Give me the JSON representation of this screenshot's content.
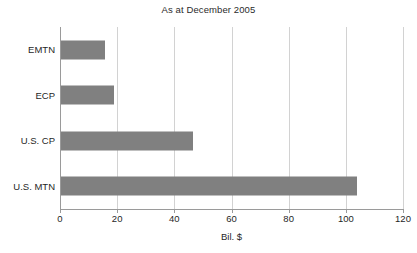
{
  "chart_data": {
    "type": "bar",
    "orientation": "horizontal",
    "title": "As at December 2005",
    "xlabel": "Bil. $",
    "ylabel": "",
    "categories": [
      "EMTN",
      "ECP",
      "U.S. CP",
      "U.S. MTN"
    ],
    "values": [
      15.7,
      19.0,
      46.5,
      104.0
    ],
    "xlim": [
      0,
      120
    ],
    "xticks": [
      0,
      20,
      40,
      60,
      80,
      100,
      120
    ],
    "xtick_labels": [
      "0",
      "20",
      "40",
      "60",
      "80",
      "100",
      "120"
    ],
    "grid": "vertical",
    "legend": "none",
    "bar_color": "#808080",
    "gridline_color": "#d2d2d2",
    "axis_color": "#9a9a9a",
    "background": "#ffffff"
  }
}
